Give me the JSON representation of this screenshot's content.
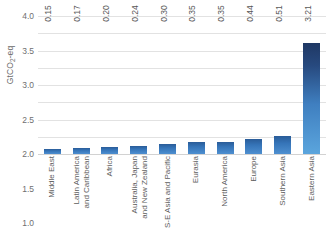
{
  "chart_data": {
    "type": "bar",
    "title": "",
    "xlabel": "",
    "ylabel": "GtCO2-eq",
    "ylabel_parts": {
      "pre": "GtCO",
      "sub": "2",
      "post": "-eq"
    },
    "ylim": [
      0.0,
      4.0
    ],
    "yticks": [
      "4.0",
      "3.5",
      "3.0",
      "2.5",
      "2.0",
      "1.5",
      "1.0",
      "0.5",
      "0.0"
    ],
    "ytick_values": [
      4.0,
      3.5,
      3.0,
      2.5,
      2.0,
      1.5,
      1.0,
      0.5,
      0.0
    ],
    "grid": true,
    "legend": "none",
    "categories": [
      "Middle East",
      "Latin America\nand Caribbean",
      "Africa",
      "Australia, Japan\nand New Zealand",
      "S-E Asia and Pacific",
      "Eurasia",
      "North America",
      "Europe",
      "Southern Asia",
      "Eastern Asia"
    ],
    "values": [
      0.15,
      0.17,
      0.2,
      0.24,
      0.3,
      0.35,
      0.35,
      0.44,
      0.51,
      3.21
    ],
    "value_labels": [
      "0.15",
      "0.17",
      "0.20",
      "0.24",
      "0.30",
      "0.35",
      "0.35",
      "0.44",
      "0.51",
      "3.21"
    ],
    "colors": {
      "bar_top": "#1f3864",
      "bar_bottom": "#5ba5dd",
      "gridline": "#e2e2e2",
      "text": "#595959",
      "background": "#ffffff"
    }
  }
}
